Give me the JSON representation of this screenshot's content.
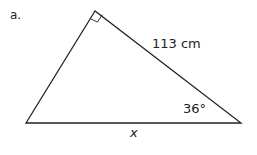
{
  "problem_label": "a.",
  "triangle": {
    "vertices": {
      "top": [
        95,
        11
      ],
      "left": [
        26,
        123
      ],
      "right": [
        241,
        123
      ]
    },
    "right_angle_at": "top",
    "side_label": "113 cm",
    "angle_label": "36°",
    "base_label": "x",
    "stroke_color": "#222222"
  }
}
